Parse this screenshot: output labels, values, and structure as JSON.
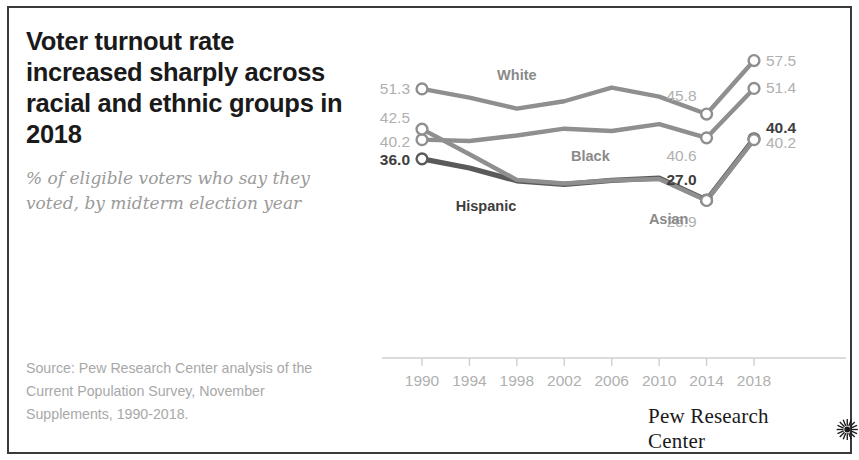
{
  "title": "Voter turnout rate increased sharply across racial and ethnic groups in 2018",
  "subtitle": "% of eligible voters who say they voted, by midterm election year",
  "source_note": "Source: Pew Research Center analysis of the Current Population Survey, November Supplements, 1990-2018.",
  "footer": {
    "brand": "Pew Research Center",
    "logo_icon": "starburst-icon"
  },
  "colors": {
    "line_light": "#8f8f8f",
    "line_dark": "#5a5a5a",
    "label_light": "#b0b0b0",
    "label_dark": "#3d3d3d",
    "title": "#1a1a1a",
    "subtitle": "#9a9a9a",
    "border": "#3a3a3a",
    "marker_fill": "#ffffff"
  },
  "chart_data": {
    "type": "line",
    "title": "Voter turnout rate increased sharply across racial and ethnic groups in 2018",
    "subtitle": "% of eligible voters who say they voted, by midterm election year",
    "xlabel": "",
    "ylabel": "",
    "x": [
      1990,
      1994,
      1998,
      2002,
      2006,
      2010,
      2014,
      2018
    ],
    "categories": [
      "1990",
      "1994",
      "1998",
      "2002",
      "2006",
      "2010",
      "2014",
      "2018"
    ],
    "xlim": [
      1990,
      2018
    ],
    "ylim": [
      20,
      62
    ],
    "grid": false,
    "legend": "inline-labels",
    "series": [
      {
        "name": "White",
        "color": "#8f8f8f",
        "emphasis": false,
        "values": [
          51.3,
          49.4,
          47.0,
          48.6,
          51.6,
          49.6,
          45.8,
          57.5
        ],
        "start_label": "51.3",
        "end_label": "57.5",
        "mid_labels": [
          {
            "x": 2014,
            "text": "45.8"
          }
        ]
      },
      {
        "name": "Black",
        "color": "#8f8f8f",
        "emphasis": false,
        "values": [
          40.2,
          39.9,
          41.1,
          42.6,
          42.1,
          43.6,
          40.6,
          51.4
        ],
        "start_label": "40.2",
        "end_label": "51.4",
        "mid_labels": [
          {
            "x": 2014,
            "text": "40.6"
          }
        ]
      },
      {
        "name": "Hispanic",
        "color": "#5a5a5a",
        "emphasis": true,
        "values": [
          36.0,
          34.0,
          31.2,
          30.4,
          31.3,
          31.8,
          27.0,
          40.4
        ],
        "start_label": "36.0",
        "end_label": "40.4",
        "mid_labels": [
          {
            "x": 2014,
            "text": "27.0"
          }
        ]
      },
      {
        "name": "Asian",
        "color": "#8f8f8f",
        "emphasis": false,
        "values": [
          42.5,
          37.0,
          31.4,
          30.6,
          31.3,
          31.6,
          26.9,
          40.2
        ],
        "start_label": "42.5",
        "end_label": "40.2",
        "mid_labels": [
          {
            "x": 2014,
            "text": "26.9"
          }
        ]
      }
    ]
  }
}
